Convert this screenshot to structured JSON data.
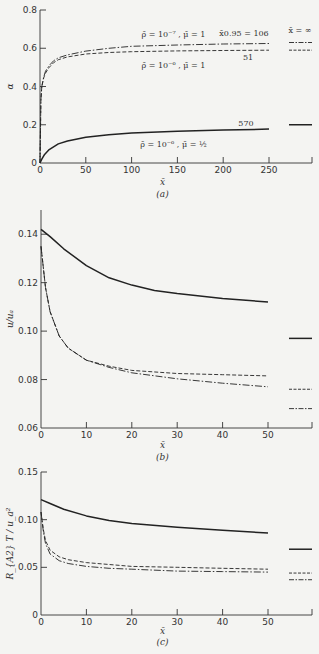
{
  "chart_data": [
    {
      "id": "a",
      "type": "line",
      "caption": "(a)",
      "xlabel": "x̄",
      "ylabel": "α",
      "xlim": [
        0,
        300
      ],
      "ylim": [
        0,
        0.8
      ],
      "xticks": [
        0,
        50,
        100,
        150,
        200,
        250
      ],
      "yticks": [
        0,
        0.2,
        0.4,
        0.6,
        0.8
      ],
      "ytick_labels": [
        "0",
        "0.2",
        "0.4",
        "0.6",
        "0.8"
      ],
      "grid": false,
      "asymptote_label": "x̄ = ∞",
      "series": [
        {
          "name": "ρ̄ = 10⁻⁷, μ̄ = 1",
          "style": "dashdot",
          "x": [
            0,
            1,
            2,
            4,
            6,
            10,
            15,
            20,
            30,
            50,
            75,
            100,
            150,
            200,
            250
          ],
          "y": [
            0,
            0.33,
            0.4,
            0.45,
            0.48,
            0.51,
            0.535,
            0.55,
            0.565,
            0.585,
            0.6,
            0.61,
            0.617,
            0.622,
            0.625
          ],
          "asymptote": 0.63,
          "end_label": "x̄0.95 = 106"
        },
        {
          "name": "ρ̄ = 10⁻⁶, μ̄ = 1",
          "style": "dashed",
          "x": [
            0,
            1,
            2,
            4,
            6,
            10,
            15,
            20,
            30,
            50,
            75,
            100,
            150,
            200,
            250
          ],
          "y": [
            0,
            0.33,
            0.4,
            0.445,
            0.47,
            0.5,
            0.525,
            0.54,
            0.555,
            0.57,
            0.578,
            0.582,
            0.586,
            0.588,
            0.59
          ],
          "asymptote": 0.59,
          "end_label": "51"
        },
        {
          "name": "ρ̄ = 10⁻⁶, μ̄ = ½",
          "style": "solid",
          "x": [
            0,
            2,
            5,
            10,
            20,
            30,
            50,
            75,
            100,
            150,
            200,
            250
          ],
          "y": [
            0,
            0.02,
            0.045,
            0.07,
            0.1,
            0.115,
            0.135,
            0.148,
            0.157,
            0.166,
            0.172,
            0.177
          ],
          "asymptote": 0.2,
          "end_label": "570"
        }
      ],
      "annotations": [
        {
          "text": "ρ̄ = 10⁻⁷ , μ̄ = 1",
          "x": 150,
          "y": 37
        },
        {
          "text": "ρ̄ = 10⁻⁶ , μ̄ = 1",
          "x": 150,
          "y": 68
        },
        {
          "text": "ρ̄ = 10⁻⁶ , μ̄ = ½",
          "x": 150,
          "y": 147
        }
      ]
    },
    {
      "id": "b",
      "type": "line",
      "caption": "(b)",
      "xlabel": "x̄",
      "ylabel": "u/uₐ",
      "xlim": [
        0,
        60
      ],
      "ylim": [
        0.06,
        0.15
      ],
      "xticks": [
        0,
        10,
        20,
        30,
        40,
        50
      ],
      "yticks": [
        0.06,
        0.08,
        0.1,
        0.12,
        0.14
      ],
      "ytick_labels": [
        "0.06",
        "0.08",
        "0.10",
        "0.12",
        "0.14"
      ],
      "grid": false,
      "series": [
        {
          "name": "ρ̄ = 10⁻⁶, μ̄ = ½",
          "style": "solid",
          "x": [
            0,
            2,
            5,
            10,
            15,
            20,
            25,
            30,
            40,
            50
          ],
          "y": [
            0.142,
            0.139,
            0.134,
            0.127,
            0.122,
            0.119,
            0.1168,
            0.1155,
            0.1135,
            0.112
          ],
          "asymptote": 0.097
        },
        {
          "name": "ρ̄ = 10⁻⁶, μ̄ = 1",
          "style": "dashed",
          "x": [
            0,
            1,
            2,
            4,
            6,
            10,
            15,
            20,
            30,
            40,
            50
          ],
          "y": [
            0.135,
            0.118,
            0.108,
            0.098,
            0.093,
            0.088,
            0.0855,
            0.0838,
            0.0825,
            0.082,
            0.0815
          ],
          "asymptote": 0.076
        },
        {
          "name": "ρ̄ = 10⁻⁷, μ̄ = 1",
          "style": "dashdot",
          "x": [
            0,
            1,
            2,
            4,
            6,
            10,
            15,
            20,
            30,
            40,
            50
          ],
          "y": [
            0.135,
            0.118,
            0.108,
            0.098,
            0.093,
            0.088,
            0.085,
            0.0828,
            0.0803,
            0.0785,
            0.077
          ],
          "asymptote": 0.068
        }
      ]
    },
    {
      "id": "c",
      "type": "line",
      "caption": "(c)",
      "xlabel": "x̄",
      "ylabel": "R_{A2} T / u_a²",
      "xlim": [
        0,
        60
      ],
      "ylim": [
        0,
        0.15
      ],
      "xticks": [
        0,
        10,
        20,
        30,
        40,
        50
      ],
      "yticks": [
        0,
        0.05,
        0.1,
        0.15
      ],
      "ytick_labels": [
        "0",
        "0.05",
        "0.10",
        "0.15"
      ],
      "grid": false,
      "series": [
        {
          "name": "ρ̄ = 10⁻⁶, μ̄ = ½",
          "style": "solid",
          "x": [
            0,
            2,
            5,
            10,
            15,
            20,
            30,
            40,
            50
          ],
          "y": [
            0.121,
            0.117,
            0.111,
            0.104,
            0.099,
            0.096,
            0.092,
            0.089,
            0.086
          ],
          "asymptote": 0.069
        },
        {
          "name": "ρ̄ = 10⁻⁶, μ̄ = 1",
          "style": "dashed",
          "x": [
            0,
            0.5,
            1,
            2,
            4,
            6,
            10,
            15,
            20,
            30,
            40,
            50
          ],
          "y": [
            0.108,
            0.09,
            0.078,
            0.068,
            0.061,
            0.058,
            0.055,
            0.053,
            0.051,
            0.05,
            0.049,
            0.048
          ],
          "asymptote": 0.044
        },
        {
          "name": "ρ̄ = 10⁻⁷, μ̄ = 1",
          "style": "dashdot",
          "x": [
            0,
            0.5,
            1,
            2,
            4,
            6,
            10,
            15,
            20,
            30,
            40,
            50
          ],
          "y": [
            0.108,
            0.088,
            0.075,
            0.064,
            0.057,
            0.054,
            0.051,
            0.049,
            0.048,
            0.046,
            0.0455,
            0.045
          ],
          "asymptote": 0.037
        }
      ]
    }
  ],
  "layout": [
    {
      "id": "a",
      "x0": 40,
      "x1": 312,
      "y0": 163,
      "y1": 10,
      "xlabel_y": 185,
      "caption_y": 197,
      "plot_xmax_px": 269,
      "asym_x0": 289,
      "asym_x1": 312
    },
    {
      "id": "b",
      "x0": 41,
      "x1": 312,
      "y0": 428,
      "y1": 210,
      "xlabel_y": 448,
      "caption_y": 460,
      "plot_xmax_px": 268,
      "asym_x0": 289,
      "asym_x1": 312
    },
    {
      "id": "c",
      "x0": 41,
      "x1": 312,
      "y0": 615,
      "y1": 472,
      "xlabel_y": 634,
      "caption_y": 645,
      "plot_xmax_px": 268,
      "asym_x0": 289,
      "asym_x1": 312
    }
  ]
}
